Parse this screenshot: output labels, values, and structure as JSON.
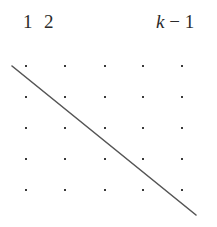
{
  "figure": {
    "width": 217,
    "height": 227,
    "background_color": "#ffffff",
    "column_labels": [
      {
        "id": "label-1",
        "text": "1",
        "x": 23,
        "baseline_y": 27,
        "italic_part": ""
      },
      {
        "id": "label-2",
        "text": "2",
        "x": 44,
        "baseline_y": 27,
        "italic_part": ""
      },
      {
        "id": "label-k-1",
        "text": "k − 1",
        "x": 156,
        "baseline_y": 27,
        "italic_part": "k"
      }
    ],
    "grid": {
      "rows": 5,
      "columns": 5,
      "dot_color": "#3a3a3a",
      "dot_size": 2,
      "column_x": [
        26,
        65,
        105,
        143,
        182
      ],
      "row_y": [
        66,
        97,
        128,
        159,
        190
      ]
    },
    "line": {
      "name": "diagonal-line",
      "x1": 12,
      "y1": 66,
      "x2": 196,
      "y2": 215,
      "color": "#555555",
      "width": 1.6
    }
  }
}
